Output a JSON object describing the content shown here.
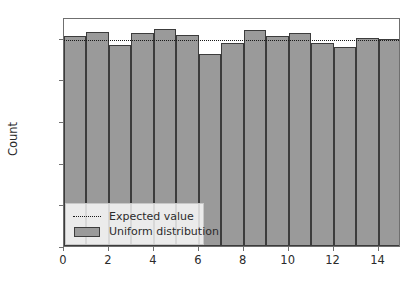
{
  "chart_data": {
    "type": "bar",
    "title": "",
    "xlabel": "",
    "ylabel": "Count",
    "xlim": [
      0,
      15
    ],
    "ylim": [
      0,
      550
    ],
    "grid": false,
    "legend_position": "lower left",
    "categories": [
      0,
      1,
      2,
      3,
      4,
      5,
      6,
      7,
      8,
      9,
      10,
      11,
      12,
      13,
      14
    ],
    "series": [
      {
        "name": "Uniform distribution",
        "type": "bar",
        "color": "#9a9a9a",
        "edgecolor": "#3c3c3c",
        "values": [
          505,
          515,
          482,
          511,
          522,
          507,
          461,
          488,
          518,
          504,
          512,
          488,
          479,
          499,
          497
        ]
      },
      {
        "name": "Expected value",
        "type": "hline",
        "color": "#1a1a1a",
        "linestyle": "dotted",
        "value": 500
      }
    ],
    "yticks": [
      0,
      100,
      200,
      300,
      400,
      500
    ],
    "ytick_labels": [
      "0",
      "100",
      "200",
      "300",
      "400",
      "500"
    ],
    "xticks": [
      0,
      2,
      4,
      6,
      8,
      10,
      12,
      14
    ],
    "xtick_labels": [
      "0",
      "2",
      "4",
      "6",
      "8",
      "10",
      "12",
      "14"
    ],
    "legend_entries": [
      {
        "label": "Expected value",
        "marker": "dotted-line"
      },
      {
        "label": "Uniform distribution",
        "marker": "filled-patch"
      }
    ]
  }
}
